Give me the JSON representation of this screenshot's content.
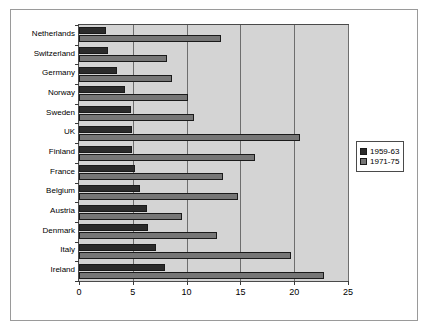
{
  "chart_data": {
    "type": "bar",
    "orientation": "horizontal",
    "title": "",
    "subtitle": "",
    "xlabel": "",
    "ylabel": "",
    "xlim": [
      0,
      25
    ],
    "xticks": [
      0,
      5,
      10,
      15,
      20,
      25
    ],
    "xtick_labels": [
      "0",
      "5",
      "10",
      "15",
      "20",
      "25"
    ],
    "grid": true,
    "grid_axis": "x",
    "legend_position": "right",
    "categories": [
      "Netherlands",
      "Switzerland",
      "Germany",
      "Norway",
      "Sweden",
      "UK",
      "Finland",
      "France",
      "Belgium",
      "Austria",
      "Denmark",
      "Italy",
      "Ireland"
    ],
    "series": [
      {
        "name": "1959-63",
        "color": "#2b2b2b",
        "values": [
          2.5,
          2.7,
          3.5,
          4.3,
          4.8,
          4.9,
          4.9,
          5.2,
          5.7,
          6.3,
          6.4,
          7.2,
          8.0
        ]
      },
      {
        "name": "1971-75",
        "color": "#767676",
        "values": [
          13.2,
          8.2,
          8.6,
          10.1,
          10.7,
          20.5,
          16.4,
          13.4,
          14.8,
          9.6,
          12.8,
          19.7,
          22.8
        ]
      }
    ]
  },
  "legend": {
    "entries": [
      "1959-63",
      "1971-75"
    ]
  }
}
